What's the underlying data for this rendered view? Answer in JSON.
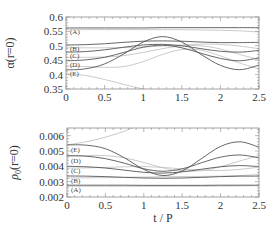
{
  "chart_data": [
    {
      "type": "line",
      "panel": "top",
      "title": "",
      "xlabel": "",
      "ylabel": "α(r=0)",
      "xlim": [
        0,
        2.5
      ],
      "ylim": [
        0.35,
        0.6
      ],
      "xticks": [
        0,
        0.5,
        1,
        1.5,
        2,
        2.5
      ],
      "xtick_labels": [
        "0",
        "0.5",
        "1",
        "1.5",
        "2",
        "2.5"
      ],
      "yticks": [
        0.35,
        0.4,
        0.45,
        0.5,
        0.55,
        0.6
      ],
      "ytick_labels": [
        "0.35",
        "0.4",
        "0.45",
        "0.5",
        "0.55",
        "0.6"
      ],
      "grid": false,
      "legend": "inline labels at left edge",
      "x": [
        0,
        0.25,
        0.5,
        0.75,
        1.0,
        1.25,
        1.5,
        1.75,
        2.0,
        2.25,
        2.5
      ],
      "series": [
        {
          "name": "(A)",
          "style": "dark",
          "values": [
            0.562,
            0.562,
            0.562,
            0.562,
            0.562,
            0.563,
            0.563,
            0.563,
            0.563,
            0.563,
            0.563
          ]
        },
        {
          "name": "(B)",
          "style": "dark",
          "values": [
            0.503,
            0.504,
            0.507,
            0.512,
            0.516,
            0.517,
            0.516,
            0.513,
            0.511,
            0.511,
            0.512
          ]
        },
        {
          "name": "(C)",
          "style": "dark",
          "values": [
            0.478,
            0.48,
            0.486,
            0.495,
            0.503,
            0.505,
            0.5,
            0.49,
            0.481,
            0.478,
            0.484
          ]
        },
        {
          "name": "(D)",
          "style": "dark",
          "values": [
            0.448,
            0.451,
            0.46,
            0.477,
            0.495,
            0.502,
            0.493,
            0.474,
            0.456,
            0.448,
            0.458
          ]
        },
        {
          "name": "(E)",
          "style": "dark",
          "values": [
            0.416,
            0.42,
            0.437,
            0.472,
            0.513,
            0.532,
            0.513,
            0.47,
            0.432,
            0.417,
            0.433
          ]
        },
        {
          "name": "(A) ref",
          "style": "light",
          "values": [
            0.556,
            0.556,
            0.556,
            0.556,
            0.556,
            0.556,
            0.556,
            0.555,
            0.554,
            0.552,
            0.548
          ]
        },
        {
          "name": "(B) ref",
          "style": "light",
          "values": [
            0.493,
            0.493,
            0.493,
            0.494,
            0.496,
            0.499,
            0.503,
            0.506,
            0.505,
            0.499,
            0.49
          ]
        },
        {
          "name": "(C) ref",
          "style": "light",
          "values": [
            0.46,
            0.46,
            0.461,
            0.466,
            0.477,
            0.49,
            0.5,
            0.5,
            0.489,
            0.47,
            0.452
          ]
        },
        {
          "name": "(D) ref",
          "style": "light",
          "values": [
            0.429,
            0.428,
            0.425,
            0.428,
            0.445,
            0.47,
            0.487,
            0.485,
            0.465,
            0.44,
            0.42
          ]
        },
        {
          "name": "(E) ref",
          "style": "light",
          "values": [
            0.403,
            0.397,
            0.383,
            0.366,
            0.35,
            0.34,
            0.335,
            0.335,
            0.335,
            0.335,
            0.335
          ]
        }
      ]
    },
    {
      "type": "line",
      "panel": "bottom",
      "title": "",
      "xlabel": "t / P",
      "ylabel": "ρ0(r=0)",
      "xlim": [
        0,
        2.5
      ],
      "ylim": [
        0.002,
        0.0065
      ],
      "xticks": [
        0,
        0.5,
        1,
        1.5,
        2,
        2.5
      ],
      "xtick_labels": [
        "0",
        "0.5",
        "1",
        "1.5",
        "2",
        "2.5"
      ],
      "yticks": [
        0.002,
        0.003,
        0.004,
        0.005,
        0.006
      ],
      "ytick_labels": [
        "0.002",
        "0.003",
        "0.004",
        "0.005",
        "0.006"
      ],
      "grid": false,
      "legend": "inline labels at left edge",
      "x": [
        0,
        0.25,
        0.5,
        0.75,
        1.0,
        1.25,
        1.5,
        1.75,
        2.0,
        2.25,
        2.5
      ],
      "series": [
        {
          "name": "(A)",
          "style": "dark",
          "values": [
            0.00277,
            0.00277,
            0.00277,
            0.00277,
            0.00276,
            0.00276,
            0.00276,
            0.00276,
            0.00277,
            0.00277,
            0.00277
          ]
        },
        {
          "name": "(B)",
          "style": "dark",
          "values": [
            0.00337,
            0.00336,
            0.00333,
            0.00328,
            0.00324,
            0.00322,
            0.00324,
            0.00328,
            0.00333,
            0.00336,
            0.00336
          ]
        },
        {
          "name": "(C)",
          "style": "dark",
          "values": [
            0.004,
            0.00397,
            0.00389,
            0.00375,
            0.00361,
            0.00356,
            0.00364,
            0.00381,
            0.00397,
            0.00405,
            0.00398
          ]
        },
        {
          "name": "(D)",
          "style": "dark",
          "values": [
            0.0047,
            0.00466,
            0.0045,
            0.0042,
            0.00384,
            0.00368,
            0.00384,
            0.00423,
            0.0046,
            0.00474,
            0.00455
          ]
        },
        {
          "name": "(E)",
          "style": "dark",
          "values": [
            0.0054,
            0.00538,
            0.00515,
            0.00455,
            0.0038,
            0.0034,
            0.0037,
            0.0045,
            0.0053,
            0.0056,
            0.00525
          ]
        },
        {
          "name": "(A) ref",
          "style": "light",
          "values": [
            0.0027,
            0.0027,
            0.0027,
            0.0027,
            0.0027,
            0.0027,
            0.0027,
            0.0027,
            0.00271,
            0.00272,
            0.00274
          ]
        },
        {
          "name": "(B) ref",
          "style": "light",
          "values": [
            0.00325,
            0.00325,
            0.00326,
            0.00328,
            0.0033,
            0.00332,
            0.00333,
            0.00334,
            0.00336,
            0.0034,
            0.00346
          ]
        },
        {
          "name": "(C) ref",
          "style": "light",
          "values": [
            0.00388,
            0.0039,
            0.00393,
            0.00397,
            0.00398,
            0.00393,
            0.00383,
            0.00375,
            0.00373,
            0.0038,
            0.00395
          ]
        },
        {
          "name": "(D) ref",
          "style": "light",
          "values": [
            0.00465,
            0.0047,
            0.0047,
            0.00455,
            0.00425,
            0.0039,
            0.0037,
            0.00372,
            0.00398,
            0.00435,
            0.0047
          ]
        },
        {
          "name": "(E) ref",
          "style": "light",
          "values": [
            0.0054,
            0.0056,
            0.0059,
            0.0063,
            0.0068,
            0.007,
            0.007,
            0.007,
            0.007,
            0.007,
            0.007
          ]
        }
      ]
    }
  ],
  "colors": {
    "dark_curve": "#555555",
    "light_curve": "#bdbdbd",
    "frame": "#8a8a8a",
    "text": "#333333"
  }
}
